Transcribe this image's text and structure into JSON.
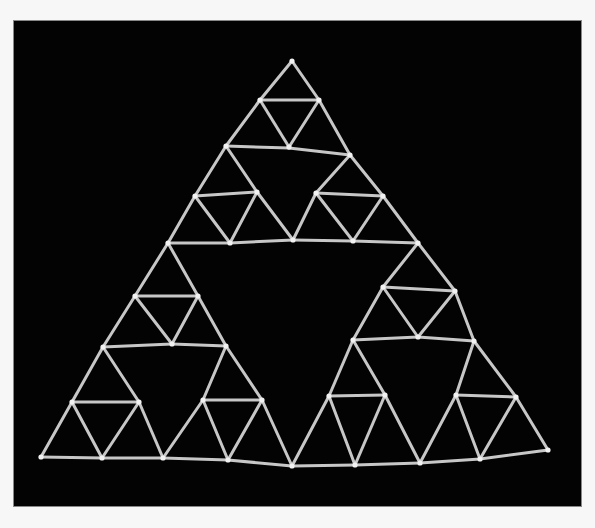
{
  "image": {
    "description": "Photograph of a Sierpinski triangle (level 4) built from sticks and joints on a black background",
    "subject": "Sierpinski triangle stick model",
    "background_color": "#030303",
    "page_color": "#f7f7f7",
    "stick_color": "#d8d8d8",
    "recursion_levels_visible": 4
  },
  "model": {
    "apex": [
      292,
      61
    ],
    "bottom_left": [
      41,
      457
    ],
    "bottom_right": [
      548,
      450
    ],
    "sticks": [
      [
        292,
        61,
        260,
        100
      ],
      [
        292,
        61,
        319,
        100
      ],
      [
        260,
        100,
        319,
        100
      ],
      [
        260,
        100,
        289,
        147
      ],
      [
        319,
        100,
        289,
        147
      ],
      [
        260,
        100,
        226,
        146
      ],
      [
        319,
        100,
        350,
        155
      ],
      [
        226,
        146,
        289,
        148
      ],
      [
        289,
        148,
        350,
        155
      ],
      [
        226,
        146,
        195,
        196
      ],
      [
        226,
        146,
        257,
        192
      ],
      [
        195,
        196,
        257,
        192
      ],
      [
        195,
        196,
        230,
        243
      ],
      [
        257,
        192,
        230,
        243
      ],
      [
        350,
        155,
        316,
        193
      ],
      [
        350,
        155,
        383,
        196
      ],
      [
        316,
        193,
        383,
        196
      ],
      [
        316,
        193,
        353,
        241
      ],
      [
        383,
        196,
        353,
        241
      ],
      [
        195,
        196,
        168,
        243
      ],
      [
        257,
        192,
        293,
        240
      ],
      [
        316,
        193,
        293,
        240
      ],
      [
        383,
        196,
        418,
        243
      ],
      [
        168,
        243,
        230,
        243
      ],
      [
        230,
        243,
        293,
        240
      ],
      [
        293,
        240,
        353,
        241
      ],
      [
        353,
        241,
        418,
        243
      ],
      [
        168,
        243,
        135,
        296
      ],
      [
        168,
        243,
        198,
        296
      ],
      [
        135,
        296,
        198,
        296
      ],
      [
        135,
        296,
        172,
        344
      ],
      [
        198,
        296,
        172,
        344
      ],
      [
        135,
        296,
        103,
        347
      ],
      [
        198,
        296,
        226,
        346
      ],
      [
        103,
        347,
        172,
        344
      ],
      [
        172,
        344,
        226,
        346
      ],
      [
        103,
        347,
        72,
        402
      ],
      [
        103,
        347,
        139,
        402
      ],
      [
        72,
        402,
        139,
        402
      ],
      [
        72,
        402,
        102,
        458
      ],
      [
        139,
        402,
        102,
        458
      ],
      [
        226,
        346,
        203,
        400
      ],
      [
        226,
        346,
        262,
        400
      ],
      [
        203,
        400,
        262,
        400
      ],
      [
        203,
        400,
        228,
        460
      ],
      [
        262,
        400,
        228,
        460
      ],
      [
        72,
        402,
        41,
        457
      ],
      [
        139,
        402,
        163,
        458
      ],
      [
        203,
        400,
        163,
        458
      ],
      [
        262,
        400,
        292,
        466
      ],
      [
        41,
        457,
        102,
        458
      ],
      [
        102,
        458,
        163,
        458
      ],
      [
        163,
        458,
        228,
        460
      ],
      [
        228,
        460,
        292,
        466
      ],
      [
        418,
        243,
        383,
        287
      ],
      [
        418,
        243,
        455,
        291
      ],
      [
        383,
        287,
        455,
        291
      ],
      [
        383,
        287,
        418,
        337
      ],
      [
        455,
        291,
        418,
        337
      ],
      [
        383,
        287,
        353,
        340
      ],
      [
        455,
        291,
        474,
        341
      ],
      [
        353,
        340,
        418,
        337
      ],
      [
        418,
        337,
        474,
        341
      ],
      [
        353,
        340,
        329,
        396
      ],
      [
        353,
        340,
        385,
        395
      ],
      [
        329,
        396,
        385,
        395
      ],
      [
        329,
        396,
        355,
        465
      ],
      [
        385,
        395,
        355,
        465
      ],
      [
        474,
        341,
        456,
        395
      ],
      [
        474,
        341,
        516,
        397
      ],
      [
        456,
        395,
        516,
        397
      ],
      [
        456,
        395,
        480,
        459
      ],
      [
        516,
        397,
        480,
        459
      ],
      [
        329,
        396,
        292,
        466
      ],
      [
        385,
        395,
        420,
        463
      ],
      [
        456,
        395,
        420,
        463
      ],
      [
        516,
        397,
        548,
        450
      ],
      [
        292,
        466,
        355,
        465
      ],
      [
        355,
        465,
        420,
        463
      ],
      [
        420,
        463,
        480,
        459
      ],
      [
        480,
        459,
        548,
        450
      ]
    ],
    "joints": [
      [
        292,
        61
      ],
      [
        260,
        100
      ],
      [
        319,
        100
      ],
      [
        289,
        147
      ],
      [
        226,
        146
      ],
      [
        350,
        155
      ],
      [
        195,
        196
      ],
      [
        257,
        192
      ],
      [
        316,
        193
      ],
      [
        383,
        196
      ],
      [
        168,
        243
      ],
      [
        230,
        243
      ],
      [
        293,
        240
      ],
      [
        353,
        241
      ],
      [
        418,
        243
      ],
      [
        135,
        296
      ],
      [
        198,
        296
      ],
      [
        172,
        344
      ],
      [
        103,
        347
      ],
      [
        226,
        346
      ],
      [
        72,
        402
      ],
      [
        139,
        402
      ],
      [
        203,
        400
      ],
      [
        262,
        400
      ],
      [
        41,
        457
      ],
      [
        102,
        458
      ],
      [
        163,
        458
      ],
      [
        228,
        460
      ],
      [
        292,
        466
      ],
      [
        383,
        287
      ],
      [
        455,
        291
      ],
      [
        418,
        337
      ],
      [
        353,
        340
      ],
      [
        474,
        341
      ],
      [
        329,
        396
      ],
      [
        385,
        395
      ],
      [
        456,
        395
      ],
      [
        516,
        397
      ],
      [
        355,
        465
      ],
      [
        420,
        463
      ],
      [
        480,
        459
      ],
      [
        548,
        450
      ]
    ]
  }
}
